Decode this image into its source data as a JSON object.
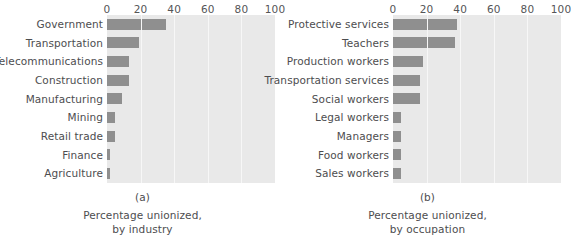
{
  "chart_data": [
    {
      "type": "bar",
      "orientation": "horizontal",
      "panel_tag": "(a)",
      "title": "",
      "caption_line1": "Percentage unionized,",
      "caption_line2": "by industry",
      "xlabel": "",
      "ylabel": "",
      "xlim": [
        0,
        100
      ],
      "ticks": [
        0,
        20,
        40,
        60,
        80,
        100
      ],
      "tick_labels": [
        "0",
        "20",
        "40",
        "60",
        "80",
        "100"
      ],
      "grid": true,
      "grid_axis": "x",
      "legend": "none",
      "bar_color": "#8f8f8f",
      "plot_background": "#e9e9e9",
      "categories": [
        "Government",
        "Transportation",
        "Telecommunications",
        "Construction",
        "Manufacturing",
        "Mining",
        "Retail trade",
        "Finance",
        "Agriculture"
      ],
      "values": [
        35,
        19,
        13,
        13,
        9,
        5,
        5,
        1.5,
        1.5
      ]
    },
    {
      "type": "bar",
      "orientation": "horizontal",
      "panel_tag": "(b)",
      "title": "",
      "caption_line1": "Percentage unionized,",
      "caption_line2": "by occupation",
      "xlabel": "",
      "ylabel": "",
      "xlim": [
        0,
        100
      ],
      "ticks": [
        0,
        20,
        40,
        60,
        80,
        100
      ],
      "tick_labels": [
        "0",
        "20",
        "40",
        "60",
        "80",
        "100"
      ],
      "grid": true,
      "grid_axis": "x",
      "legend": "none",
      "bar_color": "#8f8f8f",
      "plot_background": "#e9e9e9",
      "categories": [
        "Protective services",
        "Teachers",
        "Production workers",
        "Transportation services",
        "Social workers",
        "Legal workers",
        "Managers",
        "Food workers",
        "Sales workers"
      ],
      "values": [
        38,
        37,
        18,
        16,
        16,
        5,
        4.5,
        5,
        4.5
      ]
    }
  ]
}
